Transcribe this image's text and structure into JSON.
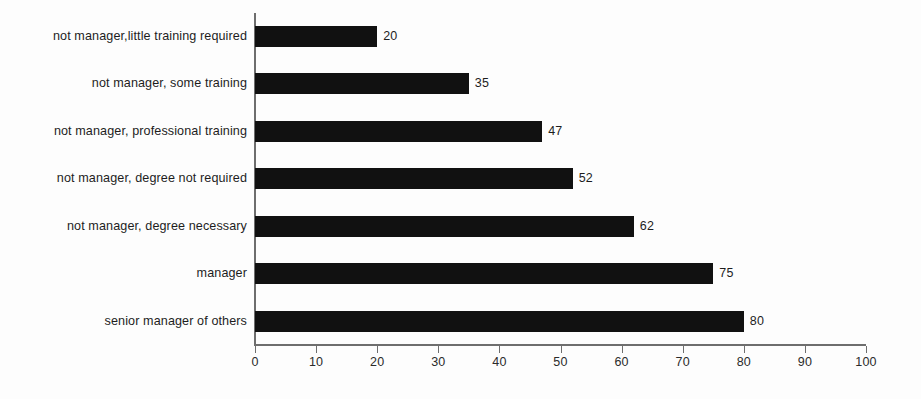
{
  "chart_data": {
    "type": "bar",
    "orientation": "horizontal",
    "title": "",
    "subtitle": "",
    "xlabel": "",
    "ylabel": "",
    "xlim": [
      0,
      100
    ],
    "xticks": [
      0,
      10,
      20,
      30,
      40,
      50,
      60,
      70,
      80,
      90,
      100
    ],
    "grid": false,
    "legend": false,
    "bar_color": "#111111",
    "axis_color": "#6e6e6e",
    "background_color": "#fdfdfd",
    "show_value_labels": true,
    "categories": [
      "not manager,little training required",
      "not manager, some training",
      "not manager, professional training",
      "not manager, degree not required",
      "not manager, degree necessary",
      "manager",
      "senior manager of others"
    ],
    "values": [
      20,
      35,
      47,
      52,
      62,
      75,
      80
    ],
    "value_labels": [
      "20",
      "35",
      "47",
      "52",
      "62",
      "75",
      "80"
    ],
    "tick_labels": [
      "0",
      "10",
      "20",
      "30",
      "40",
      "50",
      "60",
      "70",
      "80",
      "90",
      "100"
    ]
  }
}
